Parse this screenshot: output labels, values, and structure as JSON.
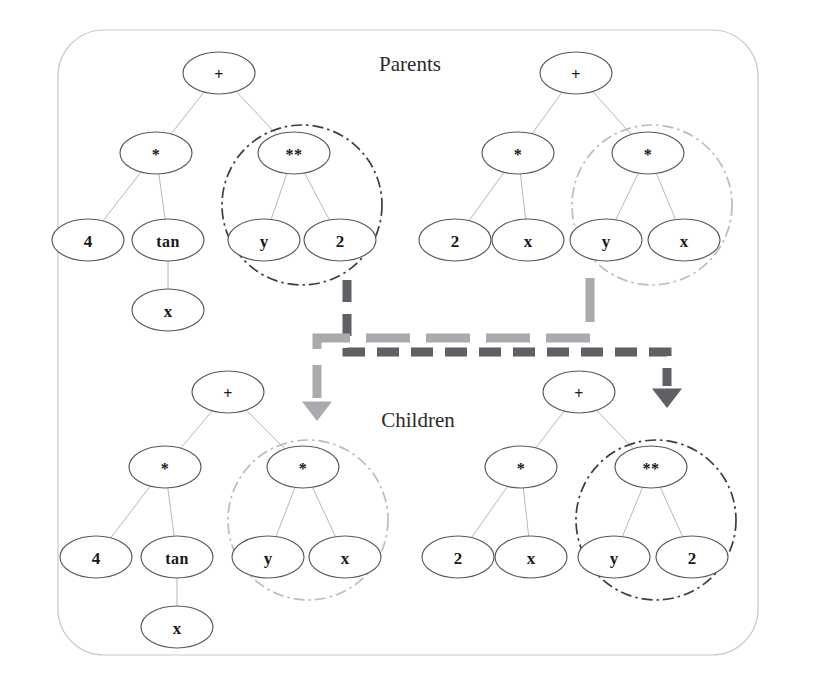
{
  "figure": {
    "title_parents": "Parents",
    "title_children": "Children",
    "frame": {
      "x": 58,
      "y": 30,
      "width": 700,
      "height": 625,
      "radius": 46,
      "color": "#c9c9cc"
    }
  },
  "labels": {
    "parents": {
      "text": "Parents",
      "x": 410,
      "y": 64
    },
    "children": {
      "text": "Children",
      "x": 418,
      "y": 420
    }
  },
  "colors": {
    "node_stroke": "#58585a",
    "node_fill": "#ffffff",
    "edge": "#b8b8bb",
    "text": "#191919",
    "highlight_dark": "#3c3c46",
    "highlight_light": "#bcbcc2",
    "arrow_dark": "#5f5f64",
    "arrow_light": "#a9a9ae",
    "frame": "#c9c9cc"
  },
  "node_size": {
    "rx": 36,
    "ry": 21
  },
  "trees": [
    {
      "id": "parent-left",
      "name": "parent-tree-left",
      "expression": "4 * tan(x) + y ** 2",
      "nodes": [
        {
          "id": "pl-root",
          "label": "+",
          "kind": "operator",
          "x": 219,
          "y": 73
        },
        {
          "id": "pl-mul",
          "label": "*",
          "kind": "operator",
          "x": 156,
          "y": 153
        },
        {
          "id": "pl-pow",
          "label": "**",
          "kind": "operator",
          "x": 294,
          "y": 153
        },
        {
          "id": "pl-4",
          "label": "4",
          "kind": "terminal",
          "x": 88,
          "y": 240
        },
        {
          "id": "pl-tan",
          "label": "tan",
          "kind": "operator",
          "x": 168,
          "y": 240
        },
        {
          "id": "pl-y",
          "label": "y",
          "kind": "terminal",
          "x": 264,
          "y": 240
        },
        {
          "id": "pl-2",
          "label": "2",
          "kind": "terminal",
          "x": 340,
          "y": 240
        },
        {
          "id": "pl-x",
          "label": "x",
          "kind": "terminal",
          "x": 168,
          "y": 310
        }
      ],
      "edges": [
        [
          "pl-root",
          "pl-mul"
        ],
        [
          "pl-root",
          "pl-pow"
        ],
        [
          "pl-mul",
          "pl-4"
        ],
        [
          "pl-mul",
          "pl-tan"
        ],
        [
          "pl-pow",
          "pl-y"
        ],
        [
          "pl-pow",
          "pl-2"
        ],
        [
          "pl-tan",
          "pl-x"
        ]
      ],
      "highlight": {
        "cx": 302,
        "cy": 205,
        "r": 80,
        "style": "dark",
        "subtree_root": "pl-pow",
        "subtree": "y ** 2"
      }
    },
    {
      "id": "parent-right",
      "name": "parent-tree-right",
      "expression": "2 * x + y * x",
      "nodes": [
        {
          "id": "pr-root",
          "label": "+",
          "kind": "operator",
          "x": 576,
          "y": 73
        },
        {
          "id": "pr-mul1",
          "label": "*",
          "kind": "operator",
          "x": 518,
          "y": 153
        },
        {
          "id": "pr-mul2",
          "label": "*",
          "kind": "operator",
          "x": 648,
          "y": 153
        },
        {
          "id": "pr-2",
          "label": "2",
          "kind": "terminal",
          "x": 455,
          "y": 240
        },
        {
          "id": "pr-x1",
          "label": "x",
          "kind": "terminal",
          "x": 528,
          "y": 240
        },
        {
          "id": "pr-y",
          "label": "y",
          "kind": "terminal",
          "x": 606,
          "y": 240
        },
        {
          "id": "pr-x2",
          "label": "x",
          "kind": "terminal",
          "x": 684,
          "y": 240
        }
      ],
      "edges": [
        [
          "pr-root",
          "pr-mul1"
        ],
        [
          "pr-root",
          "pr-mul2"
        ],
        [
          "pr-mul1",
          "pr-2"
        ],
        [
          "pr-mul1",
          "pr-x1"
        ],
        [
          "pr-mul2",
          "pr-y"
        ],
        [
          "pr-mul2",
          "pr-x2"
        ]
      ],
      "highlight": {
        "cx": 652,
        "cy": 205,
        "r": 80,
        "style": "light",
        "subtree_root": "pr-mul2",
        "subtree": "y * x"
      }
    },
    {
      "id": "child-left",
      "name": "child-tree-left",
      "expression": "4 * tan(x) + y * x",
      "nodes": [
        {
          "id": "cl-root",
          "label": "+",
          "kind": "operator",
          "x": 228,
          "y": 392
        },
        {
          "id": "cl-mul",
          "label": "*",
          "kind": "operator",
          "x": 165,
          "y": 467
        },
        {
          "id": "cl-mul2",
          "label": "*",
          "kind": "operator",
          "x": 303,
          "y": 467
        },
        {
          "id": "cl-4",
          "label": "4",
          "kind": "terminal",
          "x": 96,
          "y": 557
        },
        {
          "id": "cl-tan",
          "label": "tan",
          "kind": "operator",
          "x": 177,
          "y": 557
        },
        {
          "id": "cl-y",
          "label": "y",
          "kind": "terminal",
          "x": 268,
          "y": 557
        },
        {
          "id": "cl-x2",
          "label": "x",
          "kind": "terminal",
          "x": 345,
          "y": 557
        },
        {
          "id": "cl-x",
          "label": "x",
          "kind": "terminal",
          "x": 177,
          "y": 627
        }
      ],
      "edges": [
        [
          "cl-root",
          "cl-mul"
        ],
        [
          "cl-root",
          "cl-mul2"
        ],
        [
          "cl-mul",
          "cl-4"
        ],
        [
          "cl-mul",
          "cl-tan"
        ],
        [
          "cl-mul2",
          "cl-y"
        ],
        [
          "cl-mul2",
          "cl-x2"
        ],
        [
          "cl-tan",
          "cl-x"
        ]
      ],
      "highlight": {
        "cx": 308,
        "cy": 520,
        "r": 80,
        "style": "light",
        "subtree_root": "cl-mul2",
        "subtree": "y * x"
      }
    },
    {
      "id": "child-right",
      "name": "child-tree-right",
      "expression": "2 * x + y ** 2",
      "nodes": [
        {
          "id": "cr-root",
          "label": "+",
          "kind": "operator",
          "x": 579,
          "y": 392
        },
        {
          "id": "cr-mul",
          "label": "*",
          "kind": "operator",
          "x": 521,
          "y": 467
        },
        {
          "id": "cr-pow",
          "label": "**",
          "kind": "operator",
          "x": 651,
          "y": 467
        },
        {
          "id": "cr-2",
          "label": "2",
          "kind": "terminal",
          "x": 458,
          "y": 557
        },
        {
          "id": "cr-x",
          "label": "x",
          "kind": "terminal",
          "x": 531,
          "y": 557
        },
        {
          "id": "cr-y",
          "label": "y",
          "kind": "terminal",
          "x": 614,
          "y": 557
        },
        {
          "id": "cr-2b",
          "label": "2",
          "kind": "terminal",
          "x": 692,
          "y": 557
        }
      ],
      "edges": [
        [
          "cr-root",
          "cr-mul"
        ],
        [
          "cr-root",
          "cr-pow"
        ],
        [
          "cr-mul",
          "cr-2"
        ],
        [
          "cr-mul",
          "cr-x"
        ],
        [
          "cr-pow",
          "cr-y"
        ],
        [
          "cr-pow",
          "cr-2b"
        ]
      ],
      "highlight": {
        "cx": 656,
        "cy": 520,
        "r": 80,
        "style": "dark",
        "subtree_root": "cr-pow",
        "subtree": "y ** 2"
      }
    }
  ],
  "crossover_arrows": [
    {
      "id": "arrow-dark",
      "name": "crossover-arrow-dark",
      "from": "parent-left-subtree",
      "to": "child-right-subtree",
      "style": "dark",
      "color": "#5f5f64",
      "width": 9,
      "dash": "22 12",
      "path": "M 347,280 L 347,352 L 667,352 L 667,386",
      "head": {
        "x": 667,
        "y": 408,
        "size": 15
      }
    },
    {
      "id": "arrow-light",
      "name": "crossover-arrow-light",
      "from": "parent-right-subtree",
      "to": "child-left-subtree",
      "style": "light",
      "color": "#a9a9ae",
      "width": 9,
      "dash": "44 16",
      "path": "M 590,278 L 590,338 L 317,338 L 317,398",
      "head": {
        "x": 317,
        "y": 421,
        "size": 15
      }
    }
  ]
}
